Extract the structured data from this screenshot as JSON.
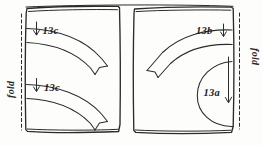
{
  "figure": {
    "kind": "sewing-pattern-diagram",
    "background_color": "#fdfdfc",
    "ink_color": "#2b2b2b"
  },
  "panels": [
    {
      "id": "left-panel",
      "name": "left fabric panel"
    },
    {
      "id": "right-panel",
      "name": "right fabric panel"
    }
  ],
  "fold_labels": [
    {
      "id": "fold-left",
      "text": "fold",
      "side": "left"
    },
    {
      "id": "fold-right",
      "text": "fold",
      "side": "right"
    }
  ],
  "piece_labels": [
    {
      "id": "label-13c-top",
      "text": "13c",
      "panel": "left-panel",
      "arrow": "down"
    },
    {
      "id": "label-13c-bottom",
      "text": "13c",
      "panel": "left-panel",
      "arrow": "down"
    },
    {
      "id": "label-13b",
      "text": "13b",
      "panel": "right-panel",
      "arrow": "down"
    },
    {
      "id": "label-13a",
      "text": "13a",
      "panel": "right-panel",
      "arrow": "down"
    }
  ]
}
